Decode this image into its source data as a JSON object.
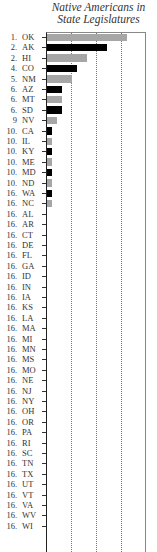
{
  "chart_data": {
    "type": "bar",
    "orientation": "horizontal",
    "title": "Native Americans in State Legislatures",
    "xlabel": "",
    "ylabel": "",
    "grid": true,
    "gridlines_x": [
      5,
      10,
      15
    ],
    "xlim": [
      0,
      20
    ],
    "legend": null,
    "colors": {
      "black": "#000000",
      "gray": "#a6a6a6"
    },
    "rows": [
      {
        "rank": "1.",
        "state": "OK",
        "value": 16,
        "color": "gray"
      },
      {
        "rank": "2.",
        "state": "AK",
        "value": 12,
        "color": "black"
      },
      {
        "rank": "2.",
        "state": "HI",
        "value": 8,
        "color": "gray"
      },
      {
        "rank": "4.",
        "state": "CO",
        "value": 6,
        "color": "black"
      },
      {
        "rank": "5.",
        "state": "NM",
        "value": 5,
        "color": "gray"
      },
      {
        "rank": "6.",
        "state": "AZ",
        "value": 3,
        "color": "black"
      },
      {
        "rank": "6.",
        "state": "MT",
        "value": 3,
        "color": "gray"
      },
      {
        "rank": "6.",
        "state": "SD",
        "value": 3,
        "color": "black"
      },
      {
        "rank": "9",
        "state": "NV",
        "value": 2,
        "color": "gray"
      },
      {
        "rank": "10.",
        "state": "CA",
        "value": 1,
        "color": "black"
      },
      {
        "rank": "10.",
        "state": "IL",
        "value": 1,
        "color": "gray"
      },
      {
        "rank": "10.",
        "state": "KY",
        "value": 1,
        "color": "black"
      },
      {
        "rank": "10.",
        "state": "ME",
        "value": 1,
        "color": "gray"
      },
      {
        "rank": "10.",
        "state": "MD",
        "value": 1,
        "color": "black"
      },
      {
        "rank": "10.",
        "state": "ND",
        "value": 1,
        "color": "gray"
      },
      {
        "rank": "16.",
        "state": "WA",
        "value": 1,
        "color": "black"
      },
      {
        "rank": "16.",
        "state": "NC",
        "value": 1,
        "color": "gray"
      },
      {
        "rank": "16.",
        "state": "AL",
        "value": 0,
        "color": "black"
      },
      {
        "rank": "16.",
        "state": "AR",
        "value": 0,
        "color": "gray"
      },
      {
        "rank": "16.",
        "state": "CT",
        "value": 0,
        "color": "black"
      },
      {
        "rank": "16.",
        "state": "DE",
        "value": 0,
        "color": "gray"
      },
      {
        "rank": "16.",
        "state": "FL",
        "value": 0,
        "color": "black"
      },
      {
        "rank": "16.",
        "state": "GA",
        "value": 0,
        "color": "gray"
      },
      {
        "rank": "16.",
        "state": "ID",
        "value": 0,
        "color": "black"
      },
      {
        "rank": "16.",
        "state": "IN",
        "value": 0,
        "color": "gray"
      },
      {
        "rank": "16.",
        "state": "IA",
        "value": 0,
        "color": "black"
      },
      {
        "rank": "16.",
        "state": "KS",
        "value": 0,
        "color": "gray"
      },
      {
        "rank": "16.",
        "state": "LA",
        "value": 0,
        "color": "black"
      },
      {
        "rank": "16.",
        "state": "MA",
        "value": 0,
        "color": "gray"
      },
      {
        "rank": "16.",
        "state": "MI",
        "value": 0,
        "color": "black"
      },
      {
        "rank": "16.",
        "state": "MN",
        "value": 0,
        "color": "gray"
      },
      {
        "rank": "16.",
        "state": "MS",
        "value": 0,
        "color": "black"
      },
      {
        "rank": "16.",
        "state": "MO",
        "value": 0,
        "color": "gray"
      },
      {
        "rank": "16.",
        "state": "NE",
        "value": 0,
        "color": "black"
      },
      {
        "rank": "16.",
        "state": "NJ",
        "value": 0,
        "color": "gray"
      },
      {
        "rank": "16.",
        "state": "NY",
        "value": 0,
        "color": "black"
      },
      {
        "rank": "16.",
        "state": "OH",
        "value": 0,
        "color": "gray"
      },
      {
        "rank": "16.",
        "state": "OR",
        "value": 0,
        "color": "black"
      },
      {
        "rank": "16.",
        "state": "PA",
        "value": 0,
        "color": "gray"
      },
      {
        "rank": "16.",
        "state": "RI",
        "value": 0,
        "color": "black"
      },
      {
        "rank": "16.",
        "state": "SC",
        "value": 0,
        "color": "gray"
      },
      {
        "rank": "16.",
        "state": "TN",
        "value": 0,
        "color": "black"
      },
      {
        "rank": "16.",
        "state": "TX",
        "value": 0,
        "color": "gray"
      },
      {
        "rank": "16.",
        "state": "UT",
        "value": 0,
        "color": "black"
      },
      {
        "rank": "16.",
        "state": "VT",
        "value": 0,
        "color": "gray"
      },
      {
        "rank": "16.",
        "state": "VA",
        "value": 0,
        "color": "black"
      },
      {
        "rank": "16.",
        "state": "WV",
        "value": 0,
        "color": "gray"
      },
      {
        "rank": "16.",
        "state": "WI",
        "value": 0,
        "color": "black"
      }
    ],
    "categories": [
      "OK",
      "AK",
      "HI",
      "CO",
      "NM",
      "AZ",
      "MT",
      "SD",
      "NV",
      "CA",
      "IL",
      "KY",
      "ME",
      "MD",
      "ND",
      "WA",
      "NC",
      "AL",
      "AR",
      "CT",
      "DE",
      "FL",
      "GA",
      "ID",
      "IN",
      "IA",
      "KS",
      "LA",
      "MA",
      "MI",
      "MN",
      "MS",
      "MO",
      "NE",
      "NJ",
      "NY",
      "OH",
      "OR",
      "PA",
      "RI",
      "SC",
      "TN",
      "TX",
      "UT",
      "VT",
      "VA",
      "WV",
      "WI"
    ],
    "values": [
      16,
      12,
      8,
      6,
      5,
      3,
      3,
      3,
      2,
      1,
      1,
      1,
      1,
      1,
      1,
      1,
      1,
      0,
      0,
      0,
      0,
      0,
      0,
      0,
      0,
      0,
      0,
      0,
      0,
      0,
      0,
      0,
      0,
      0,
      0,
      0,
      0,
      0,
      0,
      0,
      0,
      0,
      0,
      0,
      0,
      0,
      0,
      0
    ]
  },
  "title": {
    "line1": "Native Americans in",
    "line2": "State Legislatures"
  }
}
